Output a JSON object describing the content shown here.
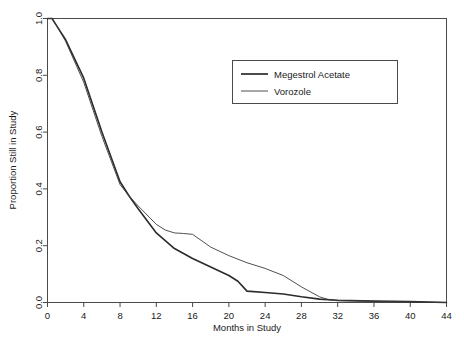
{
  "chart_data": {
    "type": "line",
    "title": "",
    "subtitle": "",
    "xlabel": "Months in Study",
    "ylabel": "Proportion Still in Study",
    "xlim": [
      0,
      44
    ],
    "ylim": [
      0,
      1.0
    ],
    "xticks": [
      "0",
      "4",
      "8",
      "12",
      "16",
      "20",
      "24",
      "28",
      "32",
      "36",
      "40",
      "44"
    ],
    "xtick_values": [
      0,
      4,
      8,
      12,
      16,
      20,
      24,
      28,
      32,
      36,
      40,
      44
    ],
    "yticks": [
      "0.0",
      "0.2",
      "0.4",
      "0.6",
      "0.8",
      "1.0"
    ],
    "ytick_values": [
      0.0,
      0.2,
      0.4,
      0.6,
      0.8,
      1.0
    ],
    "grid": false,
    "legend_position": "top-right",
    "series": [
      {
        "name": "Megestrol Acetate",
        "color": "#2b2b2b",
        "line_width": 1.6,
        "x": [
          0,
          0.5,
          1,
          2,
          4,
          6,
          8,
          9,
          10,
          12,
          14,
          16,
          18,
          20,
          21,
          22,
          24,
          26,
          28,
          30,
          32,
          36,
          40,
          44
        ],
        "y": [
          1.0,
          1.0,
          0.975,
          0.925,
          0.79,
          0.6,
          0.425,
          0.375,
          0.33,
          0.245,
          0.19,
          0.155,
          0.125,
          0.095,
          0.075,
          0.04,
          0.035,
          0.03,
          0.02,
          0.012,
          0.008,
          0.005,
          0.003,
          0.0
        ]
      },
      {
        "name": "Vorozole",
        "color": "#3c3c3c",
        "line_width": 0.9,
        "x": [
          0,
          0.5,
          1,
          2,
          4,
          6,
          8,
          9,
          10,
          12,
          13,
          14,
          15,
          16,
          18,
          20,
          22,
          24,
          26,
          28,
          30,
          31,
          32,
          36,
          40,
          44
        ],
        "y": [
          1.0,
          1.0,
          0.975,
          0.92,
          0.775,
          0.585,
          0.415,
          0.375,
          0.34,
          0.275,
          0.255,
          0.245,
          0.243,
          0.24,
          0.195,
          0.165,
          0.14,
          0.12,
          0.095,
          0.055,
          0.02,
          0.01,
          0.006,
          0.004,
          0.002,
          0.0
        ]
      }
    ]
  },
  "legend": {
    "entries": [
      {
        "label": "Megestrol Acetate"
      },
      {
        "label": "Vorozole"
      }
    ]
  }
}
